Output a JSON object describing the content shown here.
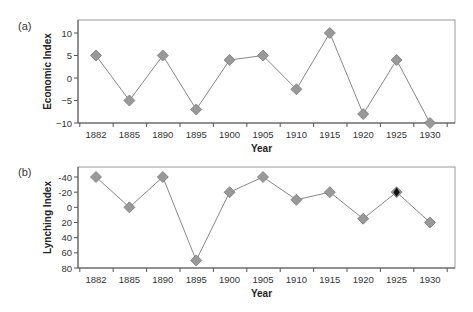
{
  "chart_data": [
    {
      "panel_label": "(a)",
      "type": "line",
      "title": "",
      "xlabel": "Year",
      "ylabel": "Economic Index",
      "categories": [
        "1882",
        "1885",
        "1890",
        "1895",
        "1900",
        "1905",
        "1910",
        "1915",
        "1920",
        "1925",
        "1930"
      ],
      "series": [
        {
          "name": "Economic Index",
          "marker": "diamond",
          "color": "#999999",
          "line_color": "#888888",
          "values": [
            5,
            -5,
            5,
            -7,
            4,
            5,
            -2.5,
            10,
            -8,
            4,
            -10
          ]
        }
      ],
      "yticks": [
        10,
        5,
        0,
        -5,
        -10
      ],
      "ytick_labels": [
        "10",
        "5",
        "0",
        "−5",
        "−10"
      ],
      "ylim": [
        -10,
        13
      ],
      "y_inverted": false,
      "grid": false,
      "legend": "none"
    },
    {
      "panel_label": "(b)",
      "type": "line",
      "title": "",
      "xlabel": "Year",
      "ylabel": "Lynching Index",
      "categories": [
        "1882",
        "1885",
        "1890",
        "1895",
        "1900",
        "1905",
        "1910",
        "1915",
        "1920",
        "1925",
        "1930"
      ],
      "series": [
        {
          "name": "Lynching Index",
          "marker": "diamond",
          "color": "#999999",
          "line_color": "#888888",
          "values": [
            -40,
            0,
            -40,
            70,
            -20,
            -40,
            -10,
            -20,
            15,
            -20,
            20
          ],
          "highlighted_index": 9,
          "highlight_color": "#111111"
        }
      ],
      "yticks": [
        -40,
        -20,
        0,
        20,
        40,
        60,
        80
      ],
      "ytick_labels": [
        "-40",
        "-20",
        "0",
        "20",
        "40",
        "60",
        "80"
      ],
      "ylim": [
        80,
        -53
      ],
      "y_inverted": true,
      "grid": false,
      "legend": "none"
    }
  ]
}
